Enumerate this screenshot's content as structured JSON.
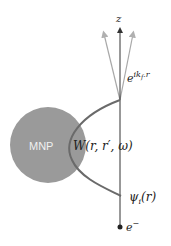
{
  "diagram": {
    "axis_label": "z",
    "particle_label": "MNP",
    "scattered_wave_label_base": "e",
    "scattered_wave_label_sup": "ik",
    "scattered_wave_label_sub": "f",
    "scattered_wave_label_tail": ".r",
    "interaction_label": "W(r, r′, ω)",
    "incident_wave_label_base": "ψ",
    "incident_wave_label_sub": "i",
    "incident_wave_label_tail": "(r)",
    "electron_label_base": "e",
    "electron_label_sup": "−"
  },
  "colors": {
    "particle": "#9a9a9a",
    "axis": "#333333",
    "rays": "#a8a8a8",
    "curve": "#6a6a6a"
  }
}
